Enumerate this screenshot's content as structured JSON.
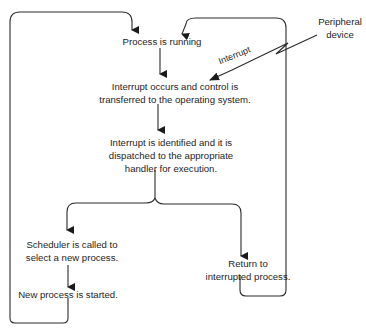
{
  "diagram": {
    "nodes": {
      "process_running": "Process is running",
      "interrupt_occurs_l1": "Interrupt occurs and control is",
      "interrupt_occurs_l2": "transferred to the operating system.",
      "identified_l1": "Interrupt is identified and it is",
      "identified_l2": "dispatched to the appropriate",
      "identified_l3": "handler for execution.",
      "scheduler_l1": "Scheduler is called to",
      "scheduler_l2": "select a new process.",
      "new_process": "New process is started.",
      "return_l1": "Return to",
      "return_l2": "interrupted process.",
      "peripheral_l1": "Peripheral",
      "peripheral_l2": "device"
    },
    "edge_labels": {
      "interrupt": "Interrupt"
    },
    "colors": {
      "line": "#2a2a2a",
      "text": "#1e1e1e",
      "background": "#ffffff"
    }
  }
}
